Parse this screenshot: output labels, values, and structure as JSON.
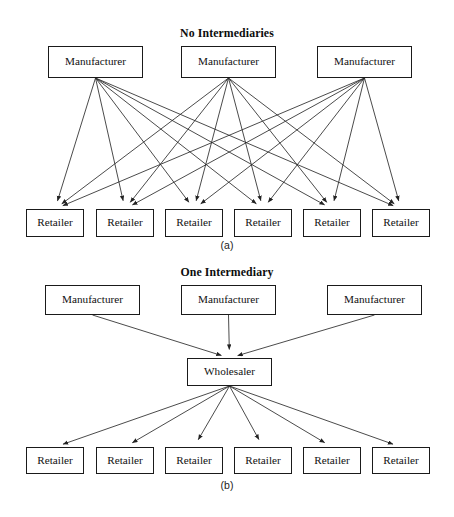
{
  "figure": {
    "background_color": "#ffffff",
    "line_color": "#2b2b2b",
    "box_border_color": "#1a1a1a"
  },
  "panels": [
    {
      "id": "panel-a",
      "title": "No Intermediaries",
      "caption": "(a)",
      "tiers": [
        {
          "role": "manufacturer",
          "nodes": [
            {
              "label": "Manufacturer",
              "x": 48,
              "y": 46,
              "w": 95,
              "h": 32
            },
            {
              "label": "Manufacturer",
              "x": 181,
              "y": 46,
              "w": 95,
              "h": 32
            },
            {
              "label": "Manufacturer",
              "x": 317,
              "y": 46,
              "w": 95,
              "h": 32
            }
          ]
        },
        {
          "role": "retailer",
          "nodes": [
            {
              "label": "Retailer",
              "x": 26,
              "y": 209,
              "w": 58,
              "h": 28
            },
            {
              "label": "Retailer",
              "x": 96,
              "y": 209,
              "w": 58,
              "h": 28
            },
            {
              "label": "Retailer",
              "x": 165,
              "y": 209,
              "w": 58,
              "h": 28
            },
            {
              "label": "Retailer",
              "x": 234,
              "y": 209,
              "w": 58,
              "h": 28
            },
            {
              "label": "Retailer",
              "x": 303,
              "y": 209,
              "w": 58,
              "h": 28
            },
            {
              "label": "Retailer",
              "x": 372,
              "y": 209,
              "w": 58,
              "h": 28
            }
          ]
        }
      ],
      "edges_description": "each of 3 manufacturers connects to all 6 retailers (18 arrows)"
    },
    {
      "id": "panel-b",
      "title": "One Intermediary",
      "caption": "(b)",
      "tiers": [
        {
          "role": "manufacturer",
          "nodes": [
            {
              "label": "Manufacturer",
              "x": 45,
              "y": 285,
              "w": 95,
              "h": 30
            },
            {
              "label": "Manufacturer",
              "x": 181,
              "y": 285,
              "w": 95,
              "h": 30
            },
            {
              "label": "Manufacturer",
              "x": 327,
              "y": 285,
              "w": 95,
              "h": 30
            }
          ]
        },
        {
          "role": "wholesaler",
          "nodes": [
            {
              "label": "Wholesaler",
              "x": 187,
              "y": 358,
              "w": 85,
              "h": 28
            }
          ]
        },
        {
          "role": "retailer",
          "nodes": [
            {
              "label": "Retailer",
              "x": 26,
              "y": 447,
              "w": 58,
              "h": 27
            },
            {
              "label": "Retailer",
              "x": 96,
              "y": 447,
              "w": 58,
              "h": 27
            },
            {
              "label": "Retailer",
              "x": 165,
              "y": 447,
              "w": 58,
              "h": 27
            },
            {
              "label": "Retailer",
              "x": 234,
              "y": 447,
              "w": 58,
              "h": 27
            },
            {
              "label": "Retailer",
              "x": 303,
              "y": 447,
              "w": 58,
              "h": 27
            },
            {
              "label": "Retailer",
              "x": 372,
              "y": 447,
              "w": 58,
              "h": 27
            }
          ]
        }
      ],
      "edges_description": "3 manufacturers converge on 1 wholesaler; wholesaler fans out to 6 retailers (9 arrows)"
    }
  ],
  "titles": {
    "panel_a_title": "No Intermediaries",
    "panel_b_title": "One Intermediary",
    "panel_a_caption": "(a)",
    "panel_b_caption": "(b)"
  }
}
